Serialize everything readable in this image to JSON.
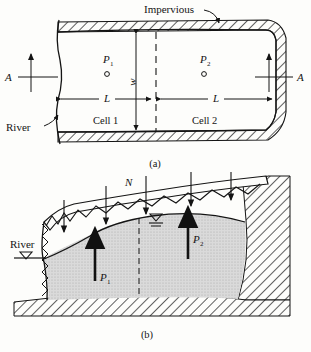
{
  "figure": {
    "panels": [
      {
        "caption": "(a)",
        "type": "plan-view",
        "labels": {
          "impervious": "Impervious",
          "river": "River",
          "cell_1": "Cell 1",
          "cell_2": "Cell 2",
          "width": "w",
          "length_left": "L",
          "length_right": "L",
          "section_left": "A",
          "section_right": "A",
          "point_1": "P",
          "point_1_sub": "1",
          "point_2": "P",
          "point_2_sub": "2"
        }
      },
      {
        "caption": "(b)",
        "type": "cross-section",
        "labels": {
          "recharge": "N",
          "river": "River",
          "pressure_1": "P",
          "pressure_1_sub": "1",
          "pressure_2": "P",
          "pressure_2_sub": "2"
        }
      }
    ],
    "colors": {
      "ink": "#141414",
      "aquifer_fill": "#d8d8d8",
      "hatch": "#2a2a2a",
      "background": "#fdfdfb"
    }
  }
}
